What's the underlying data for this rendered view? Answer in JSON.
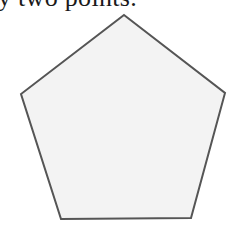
{
  "caption": {
    "text": "y two points."
  },
  "figure": {
    "shape": "pentagon",
    "fill": "#f3f3f3",
    "stroke": "#555555",
    "stroke_width": 2,
    "vertices": [
      [
        124,
        15
      ],
      [
        225,
        93
      ],
      [
        191,
        218
      ],
      [
        61,
        219
      ],
      [
        21,
        94
      ]
    ],
    "points_attr": "124,15 225,93 191,218 61,219 21,94"
  }
}
